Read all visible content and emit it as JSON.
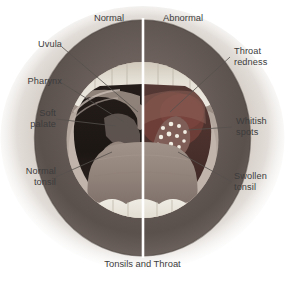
{
  "figure": {
    "caption": "Tonsils and Throat",
    "panels": {
      "left_header": "Normal",
      "right_header": "Abnormal"
    },
    "divider": {
      "color": "#ffffff",
      "orientation": "vertical"
    },
    "colors": {
      "background": "#ffffff",
      "skin_outer": "#cfc6bd",
      "lip_dark": "#5d5450",
      "lip_mid": "#8d8079",
      "teeth": "#e4e0d6",
      "teeth_shadow": "#c3bdb0",
      "gum": "#b9aca4",
      "oral_cavity_normal": "#2a2320",
      "oral_cavity_abnormal": "#4a3430",
      "throat_redness": "#6b3c36",
      "tongue": "#9a8c84",
      "tonsil_normal": "#8c7d75",
      "tonsil_swollen": "#7d5d57",
      "whitish_spots": "#f0ece2",
      "leader_line": "#55504c",
      "text": "#3c3c3c"
    },
    "labels": [
      {
        "id": "uvula",
        "text": "Uvula",
        "side": "left",
        "lines": 1
      },
      {
        "id": "pharynx",
        "text": "Pharynx",
        "side": "left",
        "lines": 1
      },
      {
        "id": "soft-palate",
        "text": "Soft\npalate",
        "side": "left",
        "lines": 2
      },
      {
        "id": "normal-tonsil",
        "text": "Normal\ntonsil",
        "side": "left",
        "lines": 2
      },
      {
        "id": "throat-redness",
        "text": "Throat\nredness",
        "side": "right",
        "lines": 2
      },
      {
        "id": "whitish-spots",
        "text": "Whitish\nspots",
        "side": "right",
        "lines": 2
      },
      {
        "id": "swollen-tonsil",
        "text": "Swollen\ntonsil",
        "side": "right",
        "lines": 2
      }
    ]
  }
}
